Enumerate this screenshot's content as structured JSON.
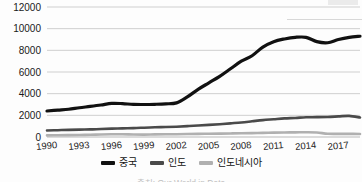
{
  "chart_data": {
    "type": "line",
    "title": "",
    "subtitle": "",
    "xlabel": "",
    "ylabel": "",
    "xlim": [
      1990,
      2019
    ],
    "ylim": [
      0,
      12000
    ],
    "ytick_values": [
      0,
      2000,
      4000,
      6000,
      8000,
      10000,
      12000
    ],
    "ytick_labels": [
      "0",
      "2000",
      "4000",
      "6000",
      "8000",
      "10000",
      "12000"
    ],
    "xtick_values": [
      1990,
      1993,
      1996,
      1999,
      2002,
      2005,
      2008,
      2011,
      2014,
      2017
    ],
    "xtick_labels": [
      "1990",
      "1993",
      "1996",
      "1999",
      "2002",
      "2005",
      "2008",
      "2011",
      "2014",
      "2017"
    ],
    "grid": "horizontal",
    "legend_position": "bottom",
    "x": [
      1990,
      1991,
      1992,
      1993,
      1994,
      1995,
      1996,
      1997,
      1998,
      1999,
      2000,
      2001,
      2002,
      2003,
      2004,
      2005,
      2006,
      2007,
      2008,
      2009,
      2010,
      2011,
      2012,
      2013,
      2014,
      2015,
      2016,
      2017,
      2018,
      2019
    ],
    "series": [
      {
        "name": "중국",
        "color": "#111111",
        "width": 3.2,
        "values": [
          2400,
          2480,
          2560,
          2700,
          2820,
          2950,
          3100,
          3080,
          3010,
          3000,
          3020,
          3060,
          3150,
          3700,
          4400,
          5000,
          5600,
          6300,
          7000,
          7500,
          8300,
          8800,
          9050,
          9200,
          9200,
          8800,
          8700,
          9000,
          9200,
          9300
        ]
      },
      {
        "name": "인도",
        "color": "#4a4a4a",
        "width": 2.6,
        "values": [
          600,
          630,
          660,
          680,
          700,
          740,
          770,
          800,
          820,
          860,
          900,
          920,
          950,
          1000,
          1060,
          1120,
          1180,
          1260,
          1340,
          1450,
          1560,
          1640,
          1720,
          1760,
          1820,
          1830,
          1850,
          1900,
          1950,
          1800
        ]
      },
      {
        "name": "인도네시아",
        "color": "#b0b0b0",
        "width": 2.6,
        "values": [
          150,
          160,
          175,
          190,
          210,
          230,
          250,
          260,
          230,
          220,
          240,
          250,
          260,
          275,
          290,
          300,
          310,
          330,
          350,
          360,
          380,
          400,
          420,
          430,
          440,
          420,
          300,
          290,
          290,
          280
        ]
      }
    ]
  },
  "legend": {
    "items": [
      {
        "label": "중국",
        "color": "#111111"
      },
      {
        "label": "인도",
        "color": "#4a4a4a"
      },
      {
        "label": "인도네시아",
        "color": "#b0b0b0"
      }
    ]
  },
  "source": {
    "text": "출처: Our World in Data"
  }
}
